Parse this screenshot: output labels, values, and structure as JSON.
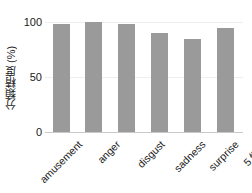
{
  "chart_data": {
    "type": "bar",
    "title": "",
    "xlabel": "",
    "ylabel": "分類精度 (%)",
    "categories": [
      "amusement",
      "anger",
      "disgust",
      "sadness",
      "surprise",
      "5 情動"
    ],
    "values": [
      98,
      100,
      98,
      90,
      85,
      95
    ],
    "ylim": [
      0,
      105
    ],
    "yticks": [
      0,
      50,
      100
    ],
    "ytick_labels": [
      "0",
      "50",
      "100"
    ],
    "grid": true,
    "legend": null,
    "bar_color": "#9a9a9a",
    "grid_color": "#eeeeee",
    "axis_color": "#c9c9c9",
    "text_color": "#1a1a1a",
    "background": "#ffffff"
  }
}
